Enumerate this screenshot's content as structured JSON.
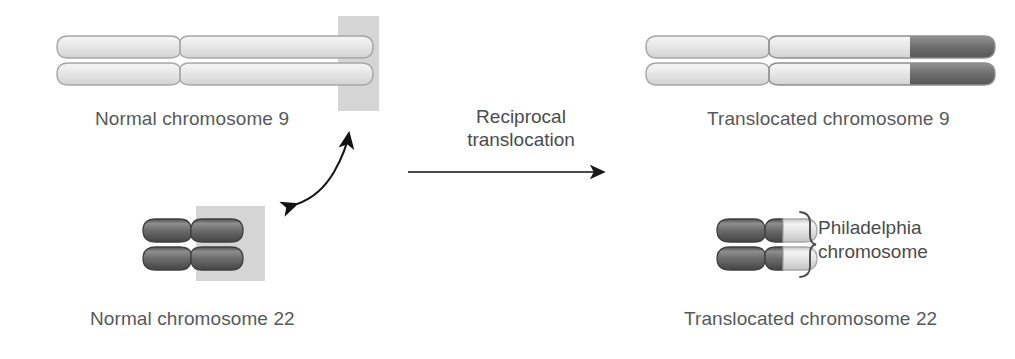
{
  "figure": {
    "type": "biology-diagram",
    "background_color": "#ffffff"
  },
  "labels": {
    "normal_9": "Normal chromosome 9",
    "normal_22": "Normal chromosome 22",
    "translocated_9": "Translocated chromosome 9",
    "translocated_22": "Translocated chromosome 22",
    "process_line1": "Reciprocal",
    "process_line2": "translocation",
    "brace_line1": "Philadelphia",
    "brace_line2": "chromosome"
  },
  "colors": {
    "chromosome_light": "#d9d9d9",
    "chromosome_light_highlight": "#f2f2f2",
    "chromosome_light_edge": "#a6a6a6",
    "chromosome_dark": "#595959",
    "chromosome_dark_highlight": "#8c8c8c",
    "chromosome_dark_edge": "#3d3d3d",
    "highlight_box": "#d3d3d3",
    "text": "#58595b",
    "arrow": "#1a1a1a"
  },
  "elements": {
    "normal_9": {
      "name": "Normal chromosome 9",
      "shade": "light",
      "segment_note": "uniform light gray, translocation breakpoint highlighted at distal right tip"
    },
    "normal_22": {
      "name": "Normal chromosome 22",
      "shade": "dark",
      "segment_note": "uniform dark gray, short chromosome, breakpoint highlighted at right arm"
    },
    "translocated_9": {
      "name": "Translocated chromosome 9",
      "shade": "light",
      "segment_note": "light gray with dark gray segment from chromosome 22 attached at right tip"
    },
    "translocated_22": {
      "name": "Translocated chromosome 22 (Philadelphia chromosome)",
      "shade": "dark",
      "segment_note": "dark gray with light gray segment from chromosome 9 attached at right tip"
    }
  },
  "annotations": {
    "exchange_arrow": "double-headed curved arrow linking the two highlighted breakpoint regions",
    "process_arrow": "straight right-pointing arrow indicating the reciprocal translocation process",
    "brace": "curly brace grouping the translocated chromosome 22"
  }
}
